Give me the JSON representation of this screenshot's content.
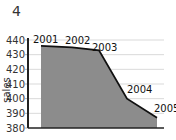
{
  "title": "4",
  "chart_data": {
    "type": "area",
    "title": "4",
    "xlabel": "",
    "ylabel": "sales",
    "categories": [
      "2001",
      "2002",
      "2003",
      "2004",
      "2005"
    ],
    "values": [
      436,
      435,
      433,
      400,
      387
    ],
    "ylim": [
      380,
      440
    ],
    "yticks": [
      380,
      390,
      400,
      410,
      420,
      430,
      440
    ],
    "grid": true,
    "legend": null,
    "fill_color": "#8c8c8c",
    "line_color": "#111111"
  }
}
